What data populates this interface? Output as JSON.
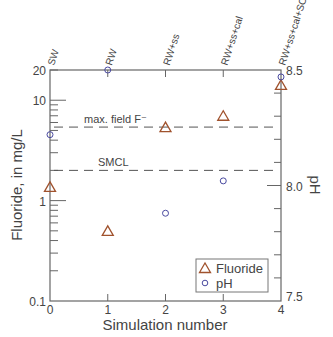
{
  "chart_data": {
    "type": "scatter",
    "title": "",
    "xlabel": "Simulation number",
    "ylabel": "Fluoride, in mg/L",
    "y2label": "pH",
    "x_ticks": [
      0,
      1,
      2,
      3,
      4
    ],
    "x_top_labels": [
      "SW",
      "RW",
      "RW+ss",
      "RW+ss+cal",
      "RW+ss+cal+SC"
    ],
    "xlim": [
      0,
      4
    ],
    "ylim": [
      0.1,
      20
    ],
    "yscale": "log",
    "y_tick_labels": [
      "20",
      "10",
      "1",
      "0.1"
    ],
    "y2lim": [
      7.5,
      8.5
    ],
    "y2_tick_labels": [
      "8.5",
      "8.0",
      "7.5"
    ],
    "grid": false,
    "legend_position": "lower right",
    "series": [
      {
        "name": "Fluoride",
        "axis": "left",
        "marker": "triangle",
        "color": "#a0522d",
        "x": [
          0,
          1,
          2,
          3,
          4
        ],
        "values": [
          1.37,
          0.5,
          5.4,
          7.0,
          14.2
        ]
      },
      {
        "name": "pH",
        "axis": "right",
        "marker": "circle",
        "color": "#4a4aa0",
        "x": [
          0,
          1,
          2,
          3,
          4
        ],
        "values": [
          8.22,
          8.5,
          7.88,
          8.02,
          8.47
        ]
      }
    ],
    "reference_lines": [
      {
        "label": "max. field F⁻",
        "value": 5.4,
        "style": "dashed"
      },
      {
        "label": "SMCL",
        "value": 2.0,
        "style": "dashed"
      }
    ]
  }
}
